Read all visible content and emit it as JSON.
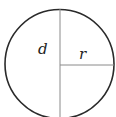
{
  "diagram": {
    "type": "circle-with-diameter-and-radius",
    "labels": {
      "diameter": "d",
      "radius": "r"
    },
    "colors": {
      "circle_stroke": "#2a2a2a",
      "line_stroke": "#8a8a8a",
      "label": "#222222",
      "background": "#ffffff"
    }
  }
}
